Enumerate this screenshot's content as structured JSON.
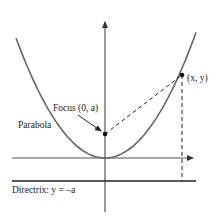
{
  "figure": {
    "labels": {
      "parabola": "Parabola",
      "focus": "Focus (0, a)",
      "point": "(x, y)",
      "directrix": "Directrix: y = –a"
    },
    "colors": {
      "curve": "#555555",
      "axes": "#333333",
      "directrix": "#222222",
      "dashed": "#222222",
      "point": "#111111"
    },
    "elements": {
      "axes": [
        "x-axis",
        "y-axis"
      ],
      "curve": "parabola y = x^2 / (4a)",
      "focus_point": "(0, a)",
      "sample_point": "(x, y)",
      "directrix_line": "y = -a",
      "dashed_segments": [
        "focus to point",
        "point to directrix"
      ]
    }
  }
}
